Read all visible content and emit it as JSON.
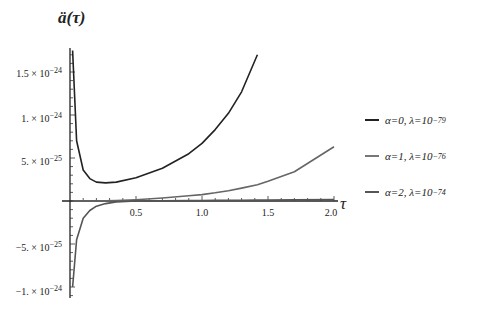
{
  "chart_data": {
    "type": "line",
    "title": "",
    "xlabel": "τ",
    "ylabel": "ä(τ)",
    "xlim": [
      0,
      2.0
    ],
    "ylim": [
      -1.1e-24,
      1.75e-24
    ],
    "grid": false,
    "legend_position": "right",
    "x_ticks": [
      "0.5",
      "1.0",
      "1.5",
      "2.0"
    ],
    "y_ticks": [
      "1.5 × 10^-24",
      "1. × 10^-24",
      "5. × 10^-25",
      "-5. × 10^-25",
      "-1. × 10^-24"
    ],
    "x": [
      0.02,
      0.05,
      0.1,
      0.15,
      0.2,
      0.27,
      0.35,
      0.5,
      0.7,
      0.9,
      1.0,
      1.1,
      1.2,
      1.3,
      1.42,
      1.5,
      1.7,
      2.0
    ],
    "series": [
      {
        "name": "α=0, λ=10^-79",
        "color": "#222222",
        "values": [
          1.75e-24,
          7e-25,
          3.6e-25,
          2.6e-25,
          2.2e-25,
          2.1e-25,
          2.2e-25,
          2.7e-25,
          3.8e-25,
          5.5e-25,
          6.7e-25,
          8.3e-25,
          1.02e-24,
          1.27e-24,
          1.7e-24,
          null,
          null,
          null
        ]
      },
      {
        "name": "α=1, λ=10^-76",
        "color": "#666666",
        "values": [
          0.0,
          0.0,
          0.0,
          0.0,
          0.0,
          1e-27,
          5e-27,
          1.5e-26,
          3.5e-26,
          6e-26,
          7.5e-26,
          9.5e-26,
          1.2e-25,
          1.5e-25,
          1.9e-25,
          2.3e-25,
          3.4e-25,
          6.3e-25
        ]
      },
      {
        "name": "α=2, λ=10^-74",
        "color": "#555555",
        "values": [
          -1e-24,
          -4.5e-25,
          -2e-25,
          -1.1e-25,
          -6e-26,
          -3e-26,
          -1e-26,
          0.0,
          3e-27,
          5e-27,
          6e-27,
          7e-27,
          8e-27,
          9e-27,
          1e-26,
          1.1e-26,
          1.3e-26,
          1.6e-26
        ]
      }
    ]
  },
  "labels": {
    "ylabel_text": "ä(τ)",
    "xlabel_text": "τ",
    "y_ticks": [
      {
        "mant": "1.5 × 10",
        "exp": "−24"
      },
      {
        "mant": "1. × 10",
        "exp": "−24"
      },
      {
        "mant": "5. × 10",
        "exp": "−25"
      },
      {
        "mant": "−5. × 10",
        "exp": "−25"
      },
      {
        "mant": "−1. × 10",
        "exp": "−24"
      }
    ],
    "x_ticks": [
      "0.5",
      "1.0",
      "1.5",
      "2.0"
    ],
    "legend": [
      {
        "text": "α=0, λ=10",
        "exp": "−79",
        "color": "#222222"
      },
      {
        "text": "α=1, λ=10",
        "exp": "−76",
        "color": "#777777"
      },
      {
        "text": "α=2, λ=10",
        "exp": "−74",
        "color": "#555555"
      }
    ]
  }
}
